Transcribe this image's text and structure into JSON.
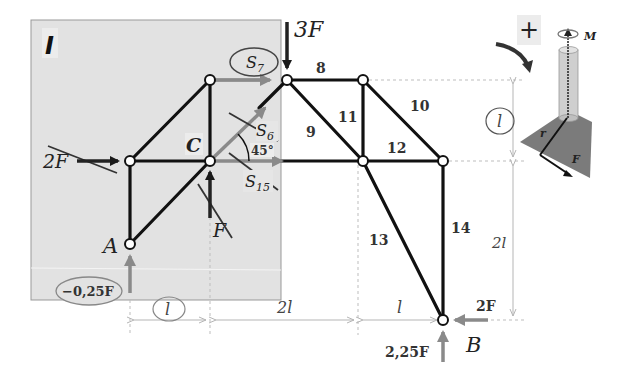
{
  "section_label": "I",
  "loads": {
    "top_load": "3F",
    "left_load": "2F",
    "c_load": "F",
    "b_horizontal": "2F",
    "b_vertical": "2,25F",
    "a_reaction": "−0,25F"
  },
  "nodes": {
    "A": "A",
    "B": "B",
    "C": "C"
  },
  "members": {
    "s7": "S",
    "s7_sub": "7",
    "s6": "S",
    "s6_sub": "6",
    "s15": "S",
    "s15_sub": "15",
    "m8": "8",
    "m9": "9",
    "m10": "10",
    "m11": "11",
    "m12": "12",
    "m13": "13",
    "m14": "14"
  },
  "angle": "45°",
  "dimensions": {
    "h1": "l",
    "h2": "2l",
    "h3": "l",
    "v1": "l",
    "v2": "2l"
  },
  "moment_legend": {
    "sign": "+",
    "moment": "M",
    "radius": "r",
    "force": "F"
  },
  "colors": {
    "panel": "#e2e2e2",
    "member": "#111111",
    "force_dark": "#222222",
    "force_gray": "#8a8a8a",
    "dim": "#b5b5b5"
  }
}
